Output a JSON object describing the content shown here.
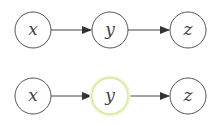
{
  "diagrams": [
    {
      "name": "chain-plain",
      "nodes": [
        {
          "id": "x",
          "label": "x",
          "highlighted": false
        },
        {
          "id": "y",
          "label": "y",
          "highlighted": false
        },
        {
          "id": "z",
          "label": "z",
          "highlighted": false
        }
      ],
      "edges": [
        [
          "x",
          "y"
        ],
        [
          "y",
          "z"
        ]
      ]
    },
    {
      "name": "chain-conditioned",
      "nodes": [
        {
          "id": "x",
          "label": "x",
          "highlighted": false
        },
        {
          "id": "y",
          "label": "y",
          "highlighted": true
        },
        {
          "id": "z",
          "label": "z",
          "highlighted": false
        }
      ],
      "edges": [
        [
          "x",
          "y"
        ],
        [
          "y",
          "z"
        ]
      ]
    }
  ],
  "colors": {
    "stroke": "#555555",
    "highlight_stroke": "#d8ea9c",
    "highlight_glow": "#f2f8dc"
  }
}
